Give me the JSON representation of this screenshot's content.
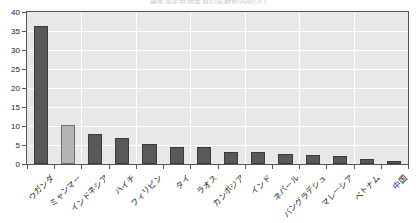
{
  "chart_data": {
    "type": "bar",
    "title": "難民認定申請者数の国籍別内訳(人)",
    "xlabel": "",
    "ylabel": "",
    "ylim": [
      0,
      40
    ],
    "ytick_step": 5,
    "ytick_labels": [
      "0",
      "5",
      "10",
      "15",
      "20",
      "25",
      "30",
      "35",
      "40"
    ],
    "grid": true,
    "legend": "none",
    "categories": [
      "ウガンダ",
      "ミャンマー",
      "インドネシア",
      "ハイチ",
      "フィリピン",
      "タイ",
      "ラオス",
      "カンボジア",
      "インド",
      "ネパール",
      "バングラデシュ",
      "マレーシア",
      "ベトナム",
      "中国"
    ],
    "values": [
      36.2,
      10.2,
      8.0,
      6.8,
      5.3,
      4.6,
      4.5,
      3.2,
      3.2,
      2.6,
      2.4,
      2.0,
      1.4,
      0.9
    ],
    "highlighted_index": 1,
    "colors": {
      "bar": "#595959",
      "bar_highlight": "#b5b5b5",
      "bar_border": "#3a3a3a",
      "bar_highlight_border": "#6e6e6e",
      "plot_background": "#e8e8e8",
      "gridline": "#ffffff",
      "axis": "#555555",
      "text": "#1a1a1a",
      "page_background": "#ffffff"
    }
  }
}
